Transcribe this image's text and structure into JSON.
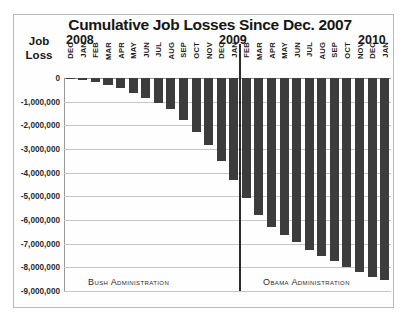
{
  "chart": {
    "title": "Cumulative Job Losses Since Dec. 2007",
    "axis_label_line1": "Job",
    "axis_label_line2": "Loss",
    "year_2008": "2008",
    "year_2009": "2009",
    "year_2010": "2010",
    "bush_label": "Bush Administration",
    "obama_label": "Obama Administration"
  },
  "chart_data": {
    "type": "bar",
    "title": "Cumulative Job Losses Since Dec. 2007",
    "xlabel": "",
    "ylabel": "Job Loss",
    "ylim": [
      -9000000,
      0
    ],
    "grid": true,
    "legend": false,
    "ytick_labels": [
      "0",
      "-1,000,000",
      "-2,000,000",
      "-3,000,000",
      "-4,000,000",
      "-5,000,000",
      "-6,000,000",
      "-7,000,000",
      "-8,000,000",
      "-9,000,000"
    ],
    "ytick_values": [
      0,
      -1000000,
      -2000000,
      -3000000,
      -4000000,
      -5000000,
      -6000000,
      -7000000,
      -8000000,
      -9000000
    ],
    "year_groups": [
      {
        "label": "2008",
        "start_index": 1
      },
      {
        "label": "2009",
        "start_index": 13
      },
      {
        "label": "2010",
        "start_index": 25
      }
    ],
    "annotations": [
      {
        "text": "Bush Administration",
        "span_start": 0,
        "span_end": 13
      },
      {
        "text": "Obama Administration",
        "span_start": 14,
        "span_end": 25
      },
      {
        "text": "administration-divider-line",
        "after_index": 13
      }
    ],
    "categories": [
      "DEC",
      "JAN",
      "FEB",
      "MAR",
      "APR",
      "MAY",
      "JUN",
      "JUL",
      "AUG",
      "SEP",
      "OCT",
      "NOV",
      "DEC",
      "JAN",
      "FEB",
      "MAR",
      "APR",
      "MAY",
      "JUN",
      "JUL",
      "AUG",
      "SEP",
      "OCT",
      "NOV",
      "DEC",
      "JAN"
    ],
    "values": [
      -20000,
      -80000,
      -170000,
      -280000,
      -430000,
      -620000,
      -840000,
      -1050000,
      -1320000,
      -1760000,
      -2280000,
      -2820000,
      -3500000,
      -4300000,
      -5050000,
      -5800000,
      -6300000,
      -6650000,
      -6950000,
      -7250000,
      -7500000,
      -7720000,
      -7980000,
      -8180000,
      -8400000,
      -8550000
    ]
  }
}
